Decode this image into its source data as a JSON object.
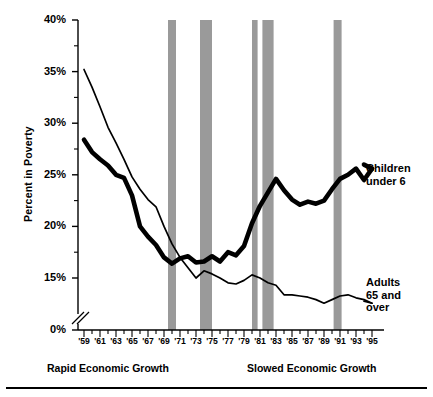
{
  "chart_data": {
    "type": "line",
    "title": "",
    "xlabel": "",
    "ylabel": "Percent  in Poverty",
    "xlim": [
      1959,
      1995
    ],
    "ylim": [
      0,
      40
    ],
    "y_axis_break": true,
    "y_break_between": [
      0,
      15
    ],
    "ytick_values": [
      0,
      15,
      20,
      25,
      30,
      35,
      40
    ],
    "ytick_labels": [
      "0%",
      "15%",
      "20%",
      "25%",
      "30%",
      "35%",
      "40%"
    ],
    "yminor_values": [
      17.5,
      22.5,
      27.5,
      32.5,
      37.5
    ],
    "grid": false,
    "legend_position": "right-inline-callouts",
    "x": [
      1959,
      1960,
      1961,
      1962,
      1963,
      1964,
      1965,
      1966,
      1967,
      1968,
      1969,
      1970,
      1971,
      1972,
      1973,
      1974,
      1975,
      1976,
      1977,
      1978,
      1979,
      1980,
      1981,
      1982,
      1983,
      1984,
      1985,
      1986,
      1987,
      1988,
      1989,
      1990,
      1991,
      1992,
      1993,
      1994,
      1995
    ],
    "xtick_labels": [
      "'59",
      "'61",
      "'63",
      "'65",
      "'67",
      "'69",
      "'71",
      "'73",
      "'75",
      "'77",
      "'79",
      "'81",
      "'83",
      "'85",
      "'87",
      "'89",
      "'91",
      "'93",
      "'95"
    ],
    "series": [
      {
        "name": "Children under 6",
        "style": "thick",
        "color": "#000000",
        "callout": [
          "Children",
          "under 6"
        ],
        "values": [
          28.4,
          27.2,
          26.5,
          25.9,
          25.0,
          24.7,
          23.0,
          20.0,
          19.0,
          18.2,
          17.0,
          16.4,
          16.9,
          17.1,
          16.5,
          16.6,
          17.1,
          16.6,
          17.5,
          17.2,
          18.1,
          20.3,
          22.0,
          23.3,
          24.6,
          23.5,
          22.6,
          22.1,
          22.4,
          22.2,
          22.5,
          23.6,
          24.6,
          25.0,
          25.6,
          24.5,
          25.6
        ]
      },
      {
        "name": "Adults 65 and over",
        "style": "thin",
        "color": "#000000",
        "callout": [
          "Adults",
          "65 and",
          "over"
        ],
        "values": [
          35.2,
          33.5,
          31.6,
          29.6,
          28.1,
          26.5,
          24.8,
          23.6,
          22.6,
          21.9,
          20.0,
          18.3,
          17.0,
          16.0,
          15.0,
          15.7,
          15.4,
          15.0,
          14.2,
          14.0,
          14.6,
          15.3,
          15.0,
          14.2,
          13.8,
          12.2,
          12.2,
          12.0,
          11.8,
          11.4,
          10.8,
          11.4,
          12.0,
          12.2,
          11.7,
          11.4,
          10.8
        ]
      }
    ],
    "shaded_bands": {
      "label": "recession",
      "color": "#9a9a9a",
      "ranges": [
        [
          1969.5,
          1970.5
        ],
        [
          1973.5,
          1975.0
        ],
        [
          1980.0,
          1980.7
        ],
        [
          1981.3,
          1982.7
        ],
        [
          1990.2,
          1991.2
        ]
      ]
    },
    "annotations": [
      {
        "id": "rapid",
        "text": "Rapid Economic Growth"
      },
      {
        "id": "slowed",
        "text": "Slowed  Economic Growth"
      }
    ]
  },
  "axis": {
    "y_title": "Percent  in Poverty"
  },
  "callouts": {
    "children": {
      "line1": "Children",
      "line2": "under 6"
    },
    "adults": {
      "line1": "Adults",
      "line2": "65 and",
      "line3": "over"
    }
  },
  "eras": {
    "rapid": "Rapid Economic Growth",
    "slowed": "Slowed  Economic Growth"
  }
}
